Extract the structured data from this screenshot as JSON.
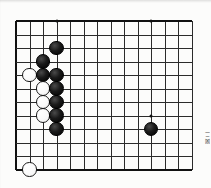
{
  "document": {
    "type": "go-board-diagram",
    "medium": "scanned book page",
    "side_note": "図 二"
  },
  "board": {
    "name": "go-board",
    "visible_columns": 14,
    "visible_rows": 12,
    "origin_x": 16,
    "origin_y": 21,
    "spacing": 13.5,
    "line_color": "#2b2b2b",
    "edge_color": "#111111",
    "background": "#fcfcfb",
    "star_points": [
      {
        "col": 4,
        "row": 1,
        "name": "hoshi-upper-left"
      },
      {
        "col": 11,
        "row": 1,
        "name": "hoshi-upper-right"
      },
      {
        "col": 11,
        "row": 8,
        "name": "hoshi-lower-right"
      }
    ],
    "stone_radius": 7.2,
    "stones": [
      {
        "id": 1,
        "color": "black",
        "col": 4,
        "row": 3,
        "name": "black-stone-d3"
      },
      {
        "id": 2,
        "color": "black",
        "col": 3,
        "row": 4,
        "name": "black-stone-c4"
      },
      {
        "id": 3,
        "color": "white",
        "col": 2,
        "row": 5,
        "name": "white-stone-b5"
      },
      {
        "id": 4,
        "color": "black",
        "col": 3,
        "row": 5,
        "name": "black-stone-c5"
      },
      {
        "id": 5,
        "color": "black",
        "col": 4,
        "row": 5,
        "name": "black-stone-d5"
      },
      {
        "id": 6,
        "color": "white",
        "col": 3,
        "row": 6,
        "name": "white-stone-c6"
      },
      {
        "id": 7,
        "color": "black",
        "col": 4,
        "row": 6,
        "name": "black-stone-d6"
      },
      {
        "id": 8,
        "color": "white",
        "col": 3,
        "row": 7,
        "name": "white-stone-c7"
      },
      {
        "id": 9,
        "color": "black",
        "col": 4,
        "row": 7,
        "name": "black-stone-d7"
      },
      {
        "id": 10,
        "color": "white",
        "col": 3,
        "row": 8,
        "name": "white-stone-c8"
      },
      {
        "id": 11,
        "color": "black",
        "col": 4,
        "row": 8,
        "name": "black-stone-d8"
      },
      {
        "id": 12,
        "color": "black",
        "col": 4,
        "row": 9,
        "name": "black-stone-d9"
      },
      {
        "id": 13,
        "color": "white",
        "col": 2,
        "row": 12,
        "name": "white-stone-b12"
      },
      {
        "id": 14,
        "color": "black",
        "col": 11,
        "row": 9,
        "name": "black-stone-k9"
      }
    ]
  },
  "counts": {
    "black_stones": 9,
    "white_stones": 5,
    "total_stones": 14
  }
}
